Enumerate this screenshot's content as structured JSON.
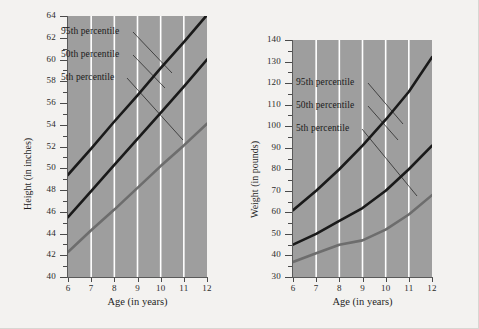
{
  "page": {
    "background": "#f3f2f0",
    "plot_background": "#9e9e9e",
    "gridline_color": "#ffffff"
  },
  "charts": [
    {
      "id": "height",
      "ylabel": "Height (in inches)",
      "xlabel": "Age (in years)",
      "annotations": [
        {
          "label": "95th percentile"
        },
        {
          "label": "50th percentile"
        },
        {
          "label": "5th percentile"
        }
      ],
      "ytick_labels": [
        "64",
        "62",
        "60",
        "58",
        "56",
        "54",
        "52",
        "50",
        "48",
        "46",
        "44",
        "42",
        "40"
      ],
      "xtick_labels": [
        "6",
        "7",
        "8",
        "9",
        "10",
        "11",
        "12"
      ]
    },
    {
      "id": "weight",
      "ylabel": "Weight (in pounds)",
      "xlabel": "Age (in years)",
      "annotations": [
        {
          "label": "95th percentile"
        },
        {
          "label": "50th percentile"
        },
        {
          "label": "5th percentile"
        }
      ],
      "ytick_labels": [
        "140",
        "130",
        "120",
        "110",
        "100",
        "90",
        "80",
        "70",
        "60",
        "50",
        "40",
        "30"
      ],
      "xtick_labels": [
        "6",
        "7",
        "8",
        "9",
        "10",
        "11",
        "12"
      ]
    }
  ],
  "chart_data": [
    {
      "type": "line",
      "title": "",
      "xlabel": "Age (in years)",
      "ylabel": "Height (in inches)",
      "x": [
        6,
        7,
        8,
        9,
        10,
        11,
        12
      ],
      "xlim": [
        6,
        12
      ],
      "ylim": [
        40,
        64
      ],
      "grid": "vertical-white",
      "legend": "inline-annotations",
      "series": [
        {
          "name": "95th percentile",
          "color": "#1a1a1a",
          "values": [
            49.4,
            51.8,
            54.3,
            56.7,
            59.2,
            61.6,
            64.1
          ]
        },
        {
          "name": "50th percentile",
          "color": "#1a1a1a",
          "values": [
            45.5,
            47.9,
            50.3,
            52.7,
            55.1,
            57.5,
            60.0
          ]
        },
        {
          "name": "5th percentile",
          "color": "#6d6d6d",
          "values": [
            42.3,
            44.3,
            46.2,
            48.2,
            50.2,
            52.1,
            54.1
          ]
        }
      ]
    },
    {
      "type": "line",
      "title": "",
      "xlabel": "Age (in years)",
      "ylabel": "Weight (in pounds)",
      "x": [
        6,
        7,
        8,
        9,
        10,
        11,
        12
      ],
      "xlim": [
        6,
        12
      ],
      "ylim": [
        30,
        140
      ],
      "grid": "vertical-white",
      "legend": "inline-annotations",
      "series": [
        {
          "name": "95th percentile",
          "color": "#1a1a1a",
          "values": [
            61,
            70,
            80,
            91,
            103,
            116,
            132
          ]
        },
        {
          "name": "50th percentile",
          "color": "#1a1a1a",
          "values": [
            45,
            50,
            56,
            62,
            70,
            80,
            91
          ]
        },
        {
          "name": "5th percentile",
          "color": "#6d6d6d",
          "values": [
            37,
            41,
            45,
            47,
            52,
            59,
            68
          ]
        }
      ]
    }
  ]
}
